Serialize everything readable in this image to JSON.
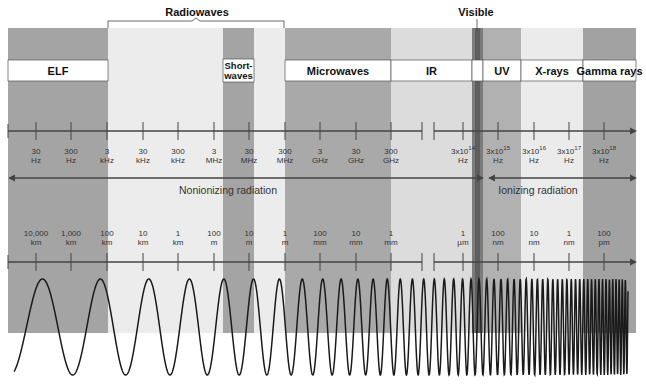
{
  "top_labels": {
    "radiowaves": "Radiowaves",
    "visible": "Visible"
  },
  "bands": [
    {
      "id": "elf",
      "label": "ELF",
      "x0": 8,
      "x1": 108,
      "shade": "#a4a4a4"
    },
    {
      "id": "radio-light",
      "label": "",
      "x0": 108,
      "x1": 223,
      "shade": "#ececec"
    },
    {
      "id": "shortwaves",
      "label": "Short-waves",
      "label_lines": [
        "Short-",
        "waves"
      ],
      "x0": 223,
      "x1": 254,
      "shade": "#a4a4a4"
    },
    {
      "id": "radio-light-2",
      "label": "",
      "x0": 254,
      "x1": 285,
      "shade": "#ececec"
    },
    {
      "id": "microwaves",
      "label": "Microwaves",
      "x0": 285,
      "x1": 391,
      "shade": "#a9a9a9"
    },
    {
      "id": "ir",
      "label": "IR",
      "x0": 391,
      "x1": 472,
      "shade": "#dcdcdc"
    },
    {
      "id": "visible",
      "label": "",
      "x0": 472,
      "x1": 483,
      "shade": "#7c7c7c"
    },
    {
      "id": "uv",
      "label": "UV",
      "x0": 483,
      "x1": 521,
      "shade": "#b1b1b1"
    },
    {
      "id": "xrays",
      "label": "X-rays",
      "x0": 521,
      "x1": 583,
      "shade": "#ebebeb"
    },
    {
      "id": "gamma",
      "label": "Gamma rays",
      "x0": 583,
      "x1": 636,
      "shade": "#a2a2a2"
    }
  ],
  "frequency_axis": {
    "ticks": [
      {
        "x": 36,
        "value": "30",
        "unit": "Hz"
      },
      {
        "x": 71,
        "value": "300",
        "unit": "Hz"
      },
      {
        "x": 107,
        "value": "3",
        "unit": "kHz"
      },
      {
        "x": 143,
        "value": "30",
        "unit": "kHz"
      },
      {
        "x": 178,
        "value": "300",
        "unit": "kHz"
      },
      {
        "x": 214,
        "value": "3",
        "unit": "MHz"
      },
      {
        "x": 249,
        "value": "30",
        "unit": "MHz"
      },
      {
        "x": 285,
        "value": "300",
        "unit": "MHz"
      },
      {
        "x": 320,
        "value": "3",
        "unit": "GHz"
      },
      {
        "x": 356,
        "value": "30",
        "unit": "GHz"
      },
      {
        "x": 391,
        "value": "300",
        "unit": "GHz"
      },
      {
        "x": 463,
        "value": "3x10",
        "exp": "14",
        "unit": "Hz"
      },
      {
        "x": 498,
        "value": "3x10",
        "exp": "15",
        "unit": "Hz"
      },
      {
        "x": 534,
        "value": "3x10",
        "exp": "16",
        "unit": "Hz"
      },
      {
        "x": 569,
        "value": "3x10",
        "exp": "17",
        "unit": "Hz"
      },
      {
        "x": 604,
        "value": "3x10",
        "exp": "18",
        "unit": "Hz"
      }
    ]
  },
  "radiation_types": {
    "nonionizing": "Nonionizing radiation",
    "ionizing": "Ionizing radiation"
  },
  "wavelength_axis": {
    "ticks": [
      {
        "x": 36,
        "value": "10,000",
        "unit": "km"
      },
      {
        "x": 71,
        "value": "1,000",
        "unit": "km"
      },
      {
        "x": 107,
        "value": "100",
        "unit": "km"
      },
      {
        "x": 143,
        "value": "10",
        "unit": "km"
      },
      {
        "x": 178,
        "value": "1",
        "unit": "km"
      },
      {
        "x": 214,
        "value": "100",
        "unit": "m"
      },
      {
        "x": 249,
        "value": "10",
        "unit": "m"
      },
      {
        "x": 285,
        "value": "1",
        "unit": "m"
      },
      {
        "x": 320,
        "value": "100",
        "unit": "mm"
      },
      {
        "x": 356,
        "value": "10",
        "unit": "mm"
      },
      {
        "x": 391,
        "value": "1",
        "unit": "mm"
      },
      {
        "x": 463,
        "value": "1",
        "unit": "µm"
      },
      {
        "x": 498,
        "value": "100",
        "unit": "nm"
      },
      {
        "x": 534,
        "value": "10",
        "unit": "nm"
      },
      {
        "x": 569,
        "value": "1",
        "unit": "nm"
      },
      {
        "x": 604,
        "value": "100",
        "unit": "pm"
      }
    ]
  }
}
